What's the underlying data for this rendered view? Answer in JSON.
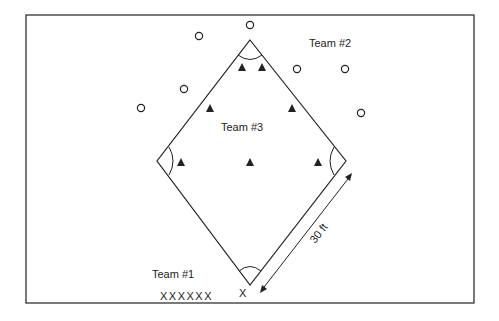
{
  "labels": {
    "team1": "Team #1",
    "team2": "Team #2",
    "team3": "Team #3",
    "distance": "30 ft"
  },
  "markers": {
    "team1_symbol": "X",
    "team1_row": "XXXXXX",
    "team2_symbol": "O",
    "team3_symbol": "triangle"
  },
  "colors": {
    "line": "#222222",
    "background": "#ffffff"
  },
  "team2_positions": [
    [
      250,
      25
    ],
    [
      199,
      36
    ],
    [
      184,
      89
    ],
    [
      141,
      108
    ],
    [
      297,
      69
    ],
    [
      345,
      69
    ],
    [
      361,
      113
    ]
  ],
  "team3_positions": [
    [
      242,
      67
    ],
    [
      262,
      67
    ],
    [
      210,
      108
    ],
    [
      292,
      108
    ],
    [
      181,
      162
    ],
    [
      250,
      162
    ],
    [
      318,
      162
    ]
  ]
}
